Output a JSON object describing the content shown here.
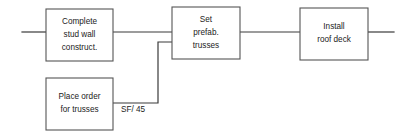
{
  "diagram": {
    "type": "activity-on-node-flowchart",
    "background_color": "#ffffff",
    "line_color": "#3a3a3a",
    "box_border_color": "#555555",
    "text_color": "#222222",
    "nodes": [
      {
        "id": "complete-stud-wall",
        "lines": [
          "Complete",
          "stud wall",
          "construct."
        ],
        "x": 46,
        "y": 9,
        "width": 67,
        "height": 52
      },
      {
        "id": "set-prefab-trusses",
        "lines": [
          "Set",
          "prefab.",
          "trusses"
        ],
        "x": 172,
        "y": 7,
        "width": 68,
        "height": 52
      },
      {
        "id": "install-roof-deck",
        "lines": [
          "Install",
          "roof deck"
        ],
        "x": 300,
        "y": 8,
        "width": 68,
        "height": 52
      },
      {
        "id": "place-order-for-trusses",
        "lines": [
          "Place order",
          "for trusses"
        ],
        "x": 46,
        "y": 78,
        "width": 67,
        "height": 52
      }
    ],
    "edges": [
      {
        "id": "entry-into-stud-wall",
        "from": "diagram-left-edge",
        "to": "complete-stud-wall",
        "points": "22,32 46,32"
      },
      {
        "id": "stud-wall-to-set-trusses",
        "from": "complete-stud-wall",
        "to": "set-prefab-trusses",
        "points": "113,32 172,32"
      },
      {
        "id": "set-trusses-to-roof-deck",
        "from": "set-prefab-trusses",
        "to": "install-roof-deck",
        "points": "240,32 300,32"
      },
      {
        "id": "roof-deck-exit",
        "from": "install-roof-deck",
        "to": "diagram-right-edge",
        "points": "368,32 394,32"
      },
      {
        "id": "place-order-to-set-trusses",
        "from": "place-order-for-trusses",
        "to": "set-prefab-trusses",
        "points": "113,103 158,103 158,42 172,42"
      }
    ],
    "edge_labels": [
      {
        "id": "sf-45-label",
        "text": "SF/ 45",
        "edge": "place-order-to-set-trusses",
        "x": 121,
        "y": 110
      }
    ]
  }
}
